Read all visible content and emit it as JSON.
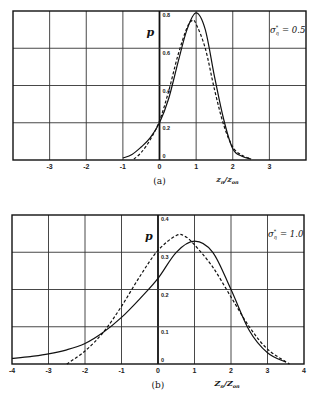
{
  "chart_data": [
    {
      "id": "a",
      "type": "line",
      "caption": "(a)",
      "annotation": "σ_η* = 0.5",
      "annotation_parts": {
        "symbol": "σ",
        "sub": "η",
        "sup": "*",
        "value": "= 0.5"
      },
      "xlabel": "z_n / z_on",
      "xlabel_parts": {
        "num": "z",
        "num_sub": "n",
        "den": "z",
        "den_sub": "on"
      },
      "ylabel": "p",
      "xlim": [
        -4,
        4
      ],
      "ylim": [
        0,
        0.8
      ],
      "grid": true,
      "x_ticks": [
        -3,
        -2,
        -1,
        0,
        1,
        2,
        3
      ],
      "x_tick_labels": [
        "-3",
        "-2",
        "-1",
        "0",
        "1",
        "2",
        "3"
      ],
      "y_ticks": [
        0,
        0.2,
        0.4,
        0.6,
        0.8
      ],
      "y_tick_labels": [
        "0",
        "0.2",
        "0.4",
        "0.6",
        "0.8"
      ],
      "series": [
        {
          "name": "solid",
          "style": "solid",
          "x": [
            -1.0,
            -0.75,
            -0.5,
            -0.25,
            0.0,
            0.25,
            0.5,
            0.75,
            1.0,
            1.25,
            1.5,
            1.75,
            2.0,
            2.25,
            2.5
          ],
          "y": [
            0.01,
            0.03,
            0.07,
            0.12,
            0.2,
            0.33,
            0.52,
            0.7,
            0.79,
            0.7,
            0.45,
            0.22,
            0.06,
            0.02,
            0.005
          ]
        },
        {
          "name": "dashed",
          "style": "dashed",
          "x": [
            -0.7,
            -0.5,
            -0.25,
            0.0,
            0.25,
            0.5,
            0.75,
            0.9,
            1.0,
            1.25,
            1.5,
            1.75,
            2.0,
            2.25,
            2.5
          ],
          "y": [
            0.005,
            0.04,
            0.11,
            0.21,
            0.37,
            0.56,
            0.71,
            0.75,
            0.73,
            0.6,
            0.38,
            0.19,
            0.07,
            0.025,
            0.008
          ]
        }
      ]
    },
    {
      "id": "b",
      "type": "line",
      "caption": "(b)",
      "annotation": "σ_η* = 1.0",
      "annotation_parts": {
        "symbol": "σ",
        "sub": "η",
        "sup": "*",
        "value": "= 1.0"
      },
      "xlabel": "Z_n / Z_on",
      "xlabel_parts": {
        "num": "Z",
        "num_sub": "n",
        "den": "Z",
        "den_sub": "on"
      },
      "ylabel": "p",
      "xlim": [
        -4,
        4
      ],
      "ylim": [
        0,
        0.4
      ],
      "grid": true,
      "x_ticks": [
        -4,
        -3,
        -2,
        -1,
        0,
        1,
        2,
        3,
        4
      ],
      "x_tick_labels": [
        "-4",
        "-3",
        "-2",
        "-1",
        "0",
        "1",
        "2",
        "3",
        "4"
      ],
      "y_ticks": [
        0,
        0.1,
        0.2,
        0.3,
        0.4
      ],
      "y_tick_labels": [
        "0",
        "0.1",
        "0.2",
        "0.3",
        "0.4"
      ],
      "series": [
        {
          "name": "solid",
          "style": "solid",
          "x": [
            -4.0,
            -3.5,
            -3.0,
            -2.5,
            -2.0,
            -1.5,
            -1.0,
            -0.5,
            0.0,
            0.5,
            1.0,
            1.5,
            2.0,
            2.5,
            3.0,
            3.5
          ],
          "y": [
            0.015,
            0.02,
            0.027,
            0.038,
            0.055,
            0.085,
            0.125,
            0.175,
            0.23,
            0.3,
            0.33,
            0.3,
            0.2,
            0.09,
            0.03,
            0.005
          ]
        },
        {
          "name": "dashed",
          "style": "dashed",
          "x": [
            -2.5,
            -2.0,
            -1.5,
            -1.0,
            -0.5,
            0.0,
            0.5,
            0.75,
            1.0,
            1.5,
            2.0,
            2.5,
            3.0,
            3.6
          ],
          "y": [
            0.0,
            0.035,
            0.085,
            0.155,
            0.235,
            0.305,
            0.345,
            0.342,
            0.32,
            0.26,
            0.18,
            0.1,
            0.04,
            0.0
          ]
        }
      ]
    }
  ]
}
